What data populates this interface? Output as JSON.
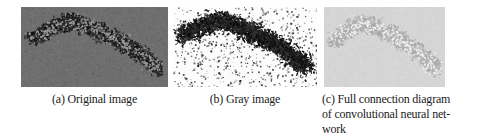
{
  "figure": {
    "panels": [
      {
        "label": "(a)",
        "caption": "(a) Original image",
        "image_alt": "grayscale photo of insect swarm on gray background",
        "render": {
          "seed": 13,
          "bg": "#6f6f6f",
          "grain_count": 3200,
          "grain_strength": 26,
          "speck_colors": [
            "#101010",
            "#1c1c1c",
            "#2d2d2d",
            "#3a3a3a"
          ],
          "highlight_color": "#989898",
          "cluster_count": 1700,
          "scatter_count": 0,
          "spread_x": 0.075,
          "spread_y": 0.13,
          "path": [
            [
              0.07,
              0.4
            ],
            [
              0.19,
              0.28
            ],
            [
              0.33,
              0.18
            ],
            [
              0.47,
              0.26
            ],
            [
              0.6,
              0.36
            ],
            [
              0.72,
              0.48
            ],
            [
              0.84,
              0.62
            ],
            [
              0.93,
              0.78
            ]
          ]
        }
      },
      {
        "label": "(b)",
        "caption": "(b) Gray image",
        "image_alt": "thresholded black-and-white speckled version of the swarm",
        "render": {
          "seed": 29,
          "bg": "#fcfcfc",
          "grain_count": 0,
          "grain_strength": 0,
          "speck_colors": [
            "#0d0d0d",
            "#1f1f1f",
            "#333333"
          ],
          "highlight_color": "",
          "cluster_count": 2300,
          "scatter_count": 750,
          "spread_x": 0.095,
          "spread_y": 0.17,
          "path": [
            [
              0.06,
              0.36
            ],
            [
              0.19,
              0.25
            ],
            [
              0.33,
              0.16
            ],
            [
              0.47,
              0.25
            ],
            [
              0.6,
              0.36
            ],
            [
              0.72,
              0.48
            ],
            [
              0.84,
              0.62
            ],
            [
              0.93,
              0.76
            ]
          ]
        }
      },
      {
        "label": "(c)",
        "caption": "(c) Full connection diagram\nof convolutional neural net-\nwork",
        "image_alt": "faint light-gray rendering of the swarm",
        "render": {
          "seed": 47,
          "bg": "#d5d5d5",
          "grain_count": 2600,
          "grain_strength": 14,
          "speck_colors": [
            "#a6a6a6",
            "#b2b2b2",
            "#bdbdbd"
          ],
          "highlight_color": "#efefef",
          "cluster_count": 1300,
          "scatter_count": 0,
          "spread_x": 0.08,
          "spread_y": 0.14,
          "path": [
            [
              0.07,
              0.42
            ],
            [
              0.19,
              0.3
            ],
            [
              0.33,
              0.2
            ],
            [
              0.47,
              0.28
            ],
            [
              0.6,
              0.38
            ],
            [
              0.72,
              0.5
            ],
            [
              0.84,
              0.63
            ],
            [
              0.93,
              0.79
            ]
          ]
        }
      }
    ]
  }
}
